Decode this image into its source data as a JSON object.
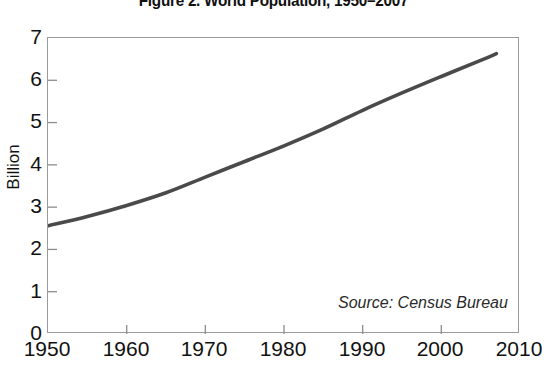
{
  "chart_data": {
    "type": "line",
    "title": "Figure 2. World Population, 1950–2007",
    "xlabel": "",
    "ylabel": "Billion",
    "xlim": [
      1950,
      2010
    ],
    "ylim": [
      0,
      7
    ],
    "grid": false,
    "legend": "none",
    "annotation": "Source: Census Bureau",
    "x_ticks": [
      "1950",
      "1960",
      "1970",
      "1980",
      "1990",
      "2000",
      "2010"
    ],
    "y_ticks": [
      "0",
      "1",
      "2",
      "3",
      "4",
      "5",
      "6",
      "7"
    ],
    "series": [
      {
        "name": "World Population",
        "color": "#4a4a4a",
        "x": [
          1950,
          1955,
          1960,
          1965,
          1970,
          1975,
          1980,
          1985,
          1990,
          1995,
          2000,
          2005,
          2007
        ],
        "values": [
          2.56,
          2.78,
          3.04,
          3.34,
          3.71,
          4.08,
          4.45,
          4.85,
          5.29,
          5.7,
          6.09,
          6.47,
          6.63
        ]
      }
    ]
  },
  "figure": {
    "title": "Figure 2. World Population, 1950–2007",
    "y_axis_title": "Billion",
    "source": "Source: Census Bureau"
  },
  "colors": {
    "line": "#4a4a4a",
    "frame": "#9a9a9a",
    "text": "#111111",
    "background": "#ffffff"
  }
}
